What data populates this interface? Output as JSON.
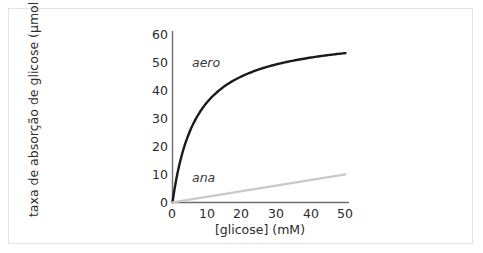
{
  "figure": {
    "background_color": "#ffffff",
    "frame_color": "#e3e3e3"
  },
  "chart_data": {
    "type": "line",
    "title": "",
    "xlabel": "[glicose] (mM)",
    "ylabel": "taxa de absorção de glicose (µmol h⁻¹)",
    "ylabel_main": "taxa de absorção de glicose (µmol h",
    "ylabel_sup": "-1",
    "ylabel_tail": ")",
    "xlim": [
      0,
      50
    ],
    "ylim": [
      0,
      63
    ],
    "xticks": [
      0,
      10,
      20,
      30,
      40,
      50
    ],
    "xtick_labels": [
      "0",
      "10",
      "20",
      "30",
      "40",
      "50"
    ],
    "yticks": [
      0,
      10,
      20,
      30,
      40,
      50,
      60
    ],
    "ytick_labels": [
      "0",
      "10",
      "20",
      "30",
      "40",
      "50",
      "60"
    ],
    "grid": false,
    "legend": "inline-annotations",
    "series": [
      {
        "name": "aero",
        "label": "aero",
        "style": "saturation-curve",
        "color": "#1a1a1a",
        "width": 2.4,
        "vmax": 61,
        "km": 7,
        "x": [
          0,
          1,
          2,
          3,
          4,
          5,
          7.5,
          10,
          12.5,
          15,
          20,
          25,
          30,
          35,
          40,
          45,
          50
        ],
        "y": [
          0,
          7.6,
          13.6,
          18.3,
          22.2,
          25.4,
          31.6,
          35.9,
          39.1,
          41.6,
          45.2,
          47.7,
          49.5,
          50.8,
          51.9,
          52.7,
          53.5
        ]
      },
      {
        "name": "ana",
        "label": "ana",
        "style": "linear",
        "color": "#c9c9c9",
        "width": 2.2,
        "slope": 0.2,
        "x": [
          0,
          50
        ],
        "y": [
          0,
          10
        ]
      }
    ],
    "axis_color": "#6e6e6e"
  }
}
